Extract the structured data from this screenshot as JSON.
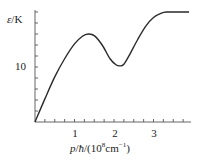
{
  "chart_data": {
    "type": "line",
    "title": "",
    "xlabel": "p/ħ/(10^8 cm^-1)",
    "ylabel": "ε/K",
    "x_ticks": [
      "1",
      "2",
      "3"
    ],
    "y_ticks": [
      "10"
    ],
    "xlim": [
      0,
      3.9
    ],
    "ylim": [
      0,
      20
    ],
    "grid": false,
    "legend": null,
    "series": [
      {
        "name": "excitation spectrum",
        "x": [
          0,
          0.25,
          0.5,
          0.75,
          1.0,
          1.2,
          1.35,
          1.5,
          1.7,
          1.9,
          2.05,
          2.15,
          2.25,
          2.4,
          2.6,
          2.8,
          3.0,
          3.2,
          3.35,
          3.5,
          3.9
        ],
        "values": [
          0,
          4.2,
          8.2,
          11.5,
          14.2,
          15.6,
          16.0,
          15.7,
          14.0,
          11.5,
          10.4,
          10.2,
          10.5,
          12.3,
          15.0,
          17.4,
          19.0,
          19.8,
          20.0,
          20.0,
          20.0
        ]
      }
    ],
    "annotations": []
  },
  "axes": {
    "y_label_symbol": "ε",
    "y_label_unit": "/K",
    "y_tick_10": "10",
    "x_tick_1": "1",
    "x_tick_2": "2",
    "x_tick_3": "3",
    "x_label_prefix": "p",
    "x_label_mid": "/",
    "x_label_hbar": "ħ",
    "x_label_open": "/(10",
    "x_label_exp": "8",
    "x_label_unit": "cm",
    "x_label_unit_exp": "−1",
    "x_label_close": ")"
  },
  "colors": {
    "curve": "#2a2a2a",
    "axis": "#555555"
  }
}
